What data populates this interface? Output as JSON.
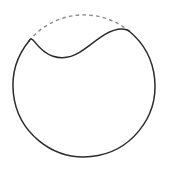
{
  "figure": {
    "kind": "geometric-line-drawing",
    "canvas": {
      "width": 169,
      "height": 170,
      "background": "#ffffff"
    },
    "colors": {
      "solid_stroke": "#2b2b2b",
      "dashed_stroke": "#8c8c8c",
      "background": "#ffffff"
    },
    "strokes": {
      "solid_width": 1.5,
      "dashed_width": 1.4,
      "dash_pattern": "3.6 3.2"
    },
    "circle": {
      "label": "outer circle",
      "center_x": 85,
      "center_y": 88,
      "radius": 71,
      "left_x": 14,
      "right_x": 156,
      "top_y": 17,
      "bottom_y": 159
    },
    "junction_left": {
      "x": 29,
      "y": 41
    },
    "junction_right": {
      "x": 129,
      "y": 31
    },
    "wave": {
      "label": "solid sinusoidal chord",
      "peak_left": {
        "x": 32,
        "y": 42
      },
      "trough": {
        "x": 62,
        "y": 57
      },
      "peak_right": {
        "x": 118,
        "y": 30
      },
      "path": "M 29 41 C 30.2 37.8 32.2 38.6 34.5 41.6 C 39.5 48.2 45 53.6 53 56.2 C 62 59.1 71 57.6 79.5 52.4 C 89 46.6 96.5 39.4 105 34.4 C 112 30.3 119 28.4 124.5 29.2 C 127 29.6 128.2 30.3 129 31"
    },
    "arcs": {
      "dashed_cap": {
        "label": "dashed upper arc of circle",
        "path": "M 29 41 A 71 71 0 0 1 129 31"
      },
      "solid_main": {
        "label": "solid remainder of circle outline",
        "path": "M 129 31 A 71 71 0 1 1 29 41"
      }
    }
  }
}
